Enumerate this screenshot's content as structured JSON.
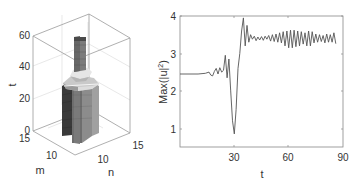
{
  "chart_data": [
    {
      "type": "surface3d",
      "title": "",
      "axes": {
        "x": {
          "label": "n",
          "ticks": [
            "10",
            "15"
          ]
        },
        "y": {
          "label": "m",
          "ticks": [
            "10",
            "15"
          ]
        },
        "z": {
          "label": "t",
          "ticks": [
            "0",
            "20",
            "40",
            "60"
          ],
          "range": [
            0,
            60
          ]
        }
      },
      "description": "3D stacked-column structure centered around m,n ≈ 10–12; broad octagonal column from t=0 to ~28, narrowing structure with light cap near t≈30–35, and a thinner column extending up to t≈60",
      "grid": true
    },
    {
      "type": "line",
      "title": "",
      "xlabel": "t",
      "ylabel": "Max(|u|²)",
      "xlim": [
        0,
        90
      ],
      "ylim": [
        0.5,
        4
      ],
      "xticks": [
        30,
        60,
        90
      ],
      "yticks": [
        1,
        2,
        3,
        4
      ],
      "grid": false,
      "series": [
        {
          "name": "Max(|u|^2)",
          "x": [
            0,
            10,
            14,
            16,
            17,
            18,
            19,
            20,
            21,
            22,
            23,
            24,
            25,
            26,
            27,
            28,
            29,
            30,
            31,
            32,
            33,
            34,
            35,
            36,
            37,
            38,
            39,
            40,
            41,
            42,
            43,
            44,
            45,
            46,
            47,
            48,
            49,
            50,
            51,
            52,
            53,
            54,
            55,
            56,
            57,
            58,
            59,
            60,
            61,
            62,
            63,
            64,
            65,
            66,
            67,
            68,
            69,
            70,
            71,
            72,
            73,
            74,
            75,
            76,
            77,
            78,
            79,
            80,
            81,
            82,
            83,
            84,
            85,
            86,
            87,
            88,
            89,
            90
          ],
          "values": [
            2.45,
            2.45,
            2.47,
            2.5,
            2.42,
            2.4,
            2.52,
            2.6,
            2.45,
            2.62,
            2.5,
            2.55,
            2.95,
            2.35,
            2.85,
            2.0,
            1.2,
            0.85,
            1.5,
            2.6,
            3.0,
            3.6,
            3.95,
            3.2,
            3.75,
            3.3,
            3.5,
            3.38,
            3.46,
            3.34,
            3.44,
            3.36,
            3.45,
            3.35,
            3.46,
            3.38,
            3.48,
            3.33,
            3.5,
            3.32,
            3.52,
            3.3,
            3.55,
            3.28,
            3.58,
            3.2,
            3.6,
            3.15,
            3.62,
            3.15,
            3.62,
            3.18,
            3.6,
            3.2,
            3.58,
            3.25,
            3.55,
            3.2,
            3.6,
            3.2,
            3.58,
            3.28,
            3.52,
            3.3,
            3.5,
            3.32,
            3.48,
            3.28,
            3.52,
            3.3,
            3.5,
            3.3,
            3.55,
            3.26
          ]
        }
      ]
    }
  ],
  "left_plot": {
    "z_label": "t",
    "m_label": "m",
    "n_label": "n",
    "z_ticks": [
      "0",
      "20",
      "40",
      "60"
    ],
    "m_ticks": [
      "15",
      "10"
    ],
    "n_ticks": [
      "10",
      "15"
    ]
  },
  "right_plot": {
    "xlabel": "t",
    "ylabel": "Max(|u|",
    "ylabel_sup": "2",
    "ylabel_close": ")",
    "x_ticks": [
      "30",
      "60",
      "90"
    ],
    "y_ticks": [
      "1",
      "2",
      "3",
      "4"
    ],
    "line_color": "#555555",
    "frame_color": "#888888"
  }
}
